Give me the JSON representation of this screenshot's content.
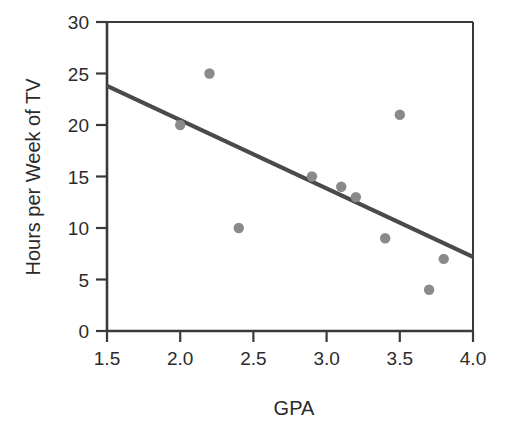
{
  "chart_data": {
    "type": "scatter",
    "title": "",
    "xlabel": "GPA",
    "ylabel": "Hours per Week of TV",
    "xlim": [
      1.5,
      4.0
    ],
    "ylim": [
      0,
      30
    ],
    "xticks": [
      "1.5",
      "2.0",
      "2.5",
      "3.0",
      "3.5",
      "4.0"
    ],
    "xtick_values": [
      1.5,
      2.0,
      2.5,
      3.0,
      3.5,
      4.0
    ],
    "yticks": [
      "0",
      "5",
      "10",
      "15",
      "20",
      "25",
      "30"
    ],
    "ytick_values": [
      0,
      5,
      10,
      15,
      20,
      25,
      30
    ],
    "grid": false,
    "legend": "none",
    "point_color": "#8a8a8a",
    "line_color": "#4a4a4a",
    "axis_color": "#3a3a3a",
    "points": [
      {
        "x": 2.0,
        "y": 20
      },
      {
        "x": 2.2,
        "y": 25
      },
      {
        "x": 2.4,
        "y": 10
      },
      {
        "x": 2.9,
        "y": 15
      },
      {
        "x": 3.1,
        "y": 14
      },
      {
        "x": 3.2,
        "y": 13
      },
      {
        "x": 3.4,
        "y": 9
      },
      {
        "x": 3.5,
        "y": 21
      },
      {
        "x": 3.7,
        "y": 4
      },
      {
        "x": 3.8,
        "y": 7
      }
    ],
    "series": [
      {
        "name": "observations",
        "x": [
          2.0,
          2.2,
          2.4,
          2.9,
          3.1,
          3.2,
          3.4,
          3.5,
          3.7,
          3.8
        ],
        "values": [
          20,
          25,
          10,
          15,
          14,
          13,
          9,
          21,
          4,
          7
        ]
      },
      {
        "name": "regression-line",
        "type": "line",
        "x": [
          1.5,
          4.0
        ],
        "values": [
          23.8,
          7.2
        ]
      }
    ],
    "annotations": []
  }
}
